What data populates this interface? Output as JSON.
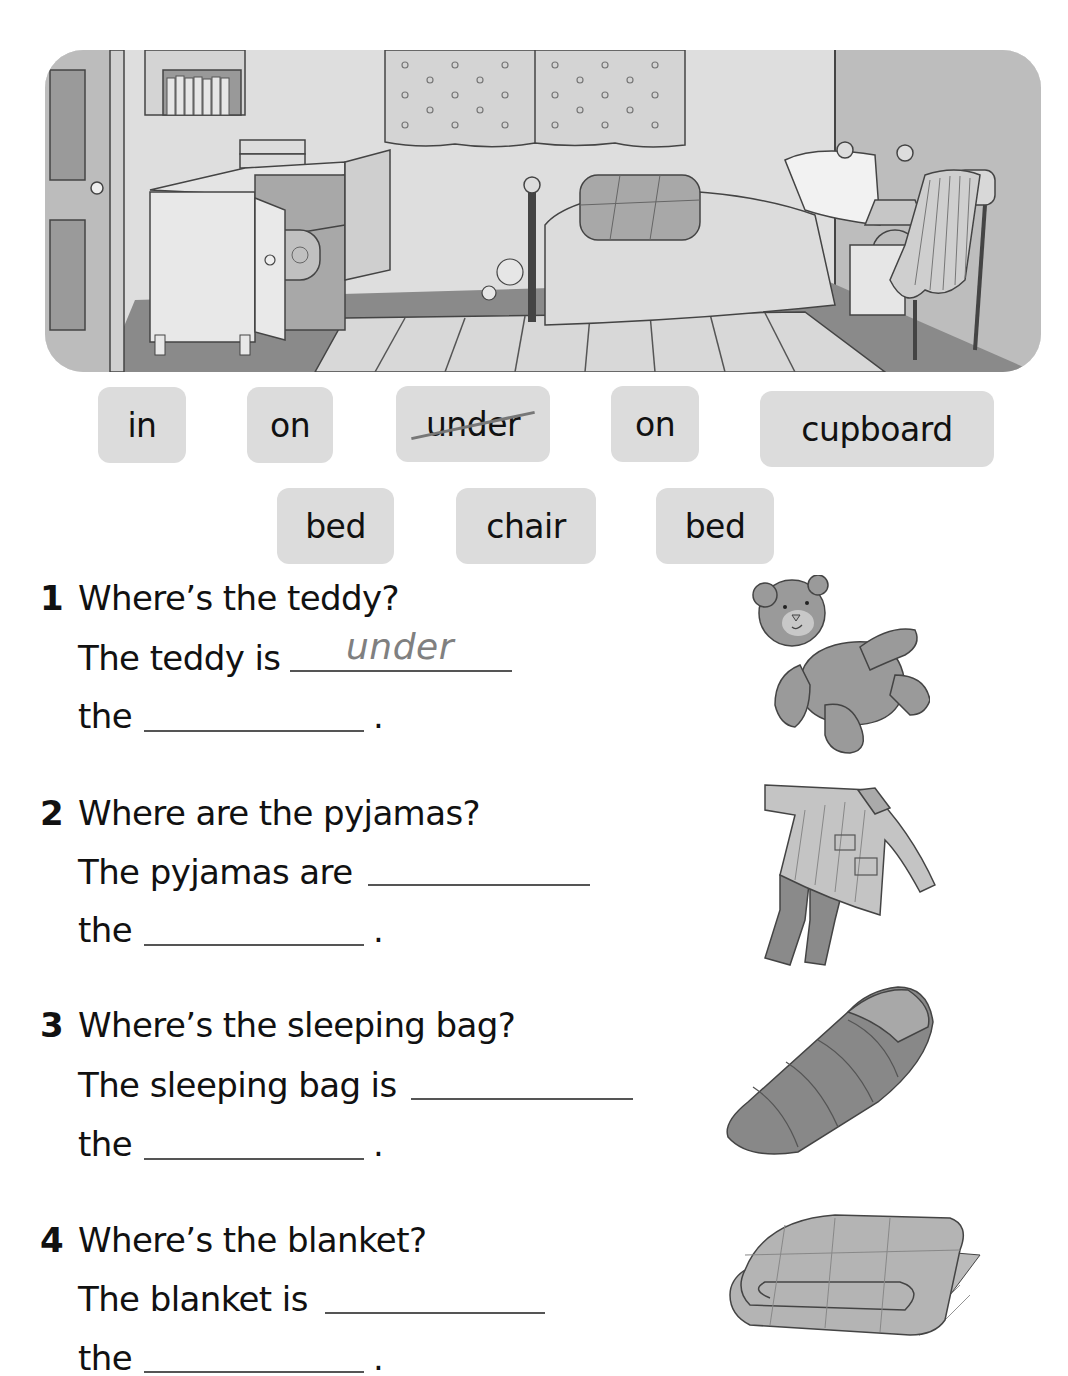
{
  "illustration": {
    "scene": "bedroom",
    "objects": [
      "door",
      "bookshelf",
      "books",
      "cupboard",
      "sleeping bag in cupboard",
      "curtains",
      "teddy under bed",
      "bed",
      "blanket on bed",
      "pillow",
      "lamp",
      "bedside table",
      "chair",
      "pyjamas on chair",
      "rug"
    ]
  },
  "word_bank": {
    "row1": [
      {
        "label": "in",
        "crossed": false
      },
      {
        "label": "on",
        "crossed": false
      },
      {
        "label": "under",
        "crossed": true
      },
      {
        "label": "on",
        "crossed": false
      },
      {
        "label": "cupboard",
        "crossed": false
      }
    ],
    "row2": [
      {
        "label": "bed",
        "crossed": false
      },
      {
        "label": "chair",
        "crossed": false
      },
      {
        "label": "bed",
        "crossed": false
      }
    ]
  },
  "questions": [
    {
      "number": "1",
      "question": "Where’s the teddy?",
      "line2": "The teddy is",
      "answer1": "under",
      "line3": "the",
      "answer2": "",
      "end": ".",
      "picture": "teddy-bear"
    },
    {
      "number": "2",
      "question": "Where are the pyjamas?",
      "line2": "The pyjamas are",
      "answer1": "",
      "line3": "the",
      "answer2": "",
      "end": ".",
      "picture": "pyjamas"
    },
    {
      "number": "3",
      "question": "Where’s the sleeping bag?",
      "line2": "The sleeping bag is",
      "answer1": "",
      "line3": "the",
      "answer2": "",
      "end": ".",
      "picture": "sleeping-bag"
    },
    {
      "number": "4",
      "question": "Where’s the blanket?",
      "line2": "The blanket is",
      "answer1": "",
      "line3": "the",
      "answer2": "",
      "end": ".",
      "picture": "blanket"
    }
  ],
  "colors": {
    "chip_bg": "#dcdcdc",
    "answer_text": "#808080",
    "text": "#111111"
  }
}
